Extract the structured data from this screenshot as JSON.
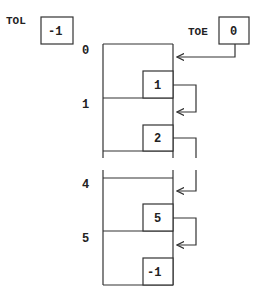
{
  "diagram": {
    "pointers": {
      "tol": {
        "label": "TOL",
        "value": "-1"
      },
      "toe": {
        "label": "TOE",
        "value": "0"
      }
    },
    "slots": [
      {
        "index": "0",
        "next": "1"
      },
      {
        "index": "1",
        "next": "2"
      },
      {
        "index": "4",
        "next": "5"
      },
      {
        "index": "5",
        "next": "-1"
      }
    ],
    "colors": {
      "line": "#333333",
      "text": "#222222",
      "background": "#ffffff"
    }
  }
}
